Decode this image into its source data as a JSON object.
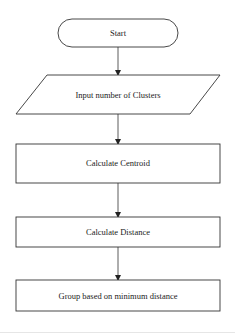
{
  "diagram": {
    "type": "flowchart",
    "nodes": [
      {
        "id": "start",
        "shape": "terminal",
        "label": "Start"
      },
      {
        "id": "input",
        "shape": "parallelogram",
        "label": "Input number of Clusters"
      },
      {
        "id": "centroid",
        "shape": "rectangle",
        "label": "Calculate Centroid"
      },
      {
        "id": "distance",
        "shape": "rectangle",
        "label": "Calculate Distance"
      },
      {
        "id": "group",
        "shape": "rectangle",
        "label": "Group based on minimum distance"
      }
    ],
    "edges": [
      {
        "from": "start",
        "to": "input"
      },
      {
        "from": "input",
        "to": "centroid"
      },
      {
        "from": "centroid",
        "to": "distance"
      },
      {
        "from": "distance",
        "to": "group"
      }
    ]
  }
}
